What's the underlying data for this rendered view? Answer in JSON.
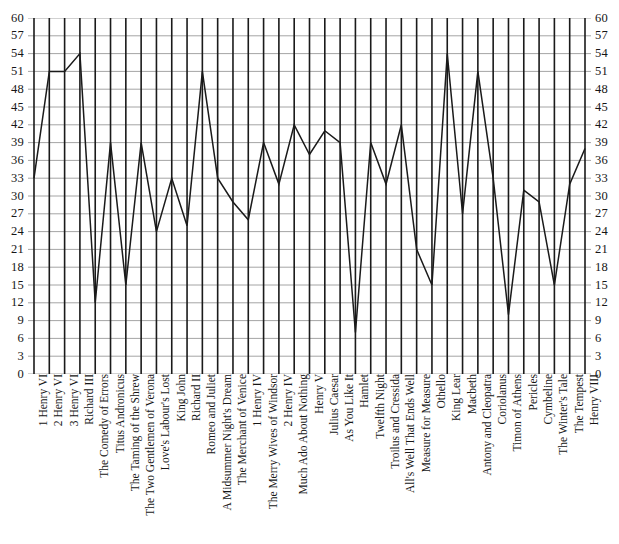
{
  "chart_data": {
    "type": "line",
    "title": "",
    "subtitle": "",
    "xlabel": "",
    "ylabel": "",
    "ylim": [
      0,
      60
    ],
    "ytick_step": 3,
    "yticks": [
      0,
      3,
      6,
      9,
      12,
      15,
      18,
      21,
      24,
      27,
      30,
      33,
      36,
      39,
      42,
      45,
      48,
      51,
      54,
      57,
      60
    ],
    "grid": true,
    "grid_vertical": true,
    "grid_horizontal": true,
    "legend": "none",
    "axis_labels_both_sides": true,
    "line_color": "#1a1a1a",
    "grid_color_horizontal": "#9a9a9a",
    "grid_color_vertical": "#1a1a1a",
    "background": "#ffffff",
    "categories": [
      "1 Henry VI",
      "2 Henry VI",
      "3 Henry VI",
      "Richard III",
      "The Comedy of Errors",
      "Titus Andronicus",
      "The Taming of the Shrew",
      "The Two Gentlemen of Verona",
      "Love's Labour's Lost",
      "King John",
      "Richard II",
      "Romeo and Juliet",
      "A Midsummer Night's Dream",
      "The Merchant of Venice",
      "1 Henry IV",
      "The Merry Wives of Windsor",
      "2 Henry IV",
      "Much Ado About Nothing",
      "Henry V",
      "Julius Caesar",
      "As You Like It",
      "Hamlet",
      "Twelfth Night",
      "Troilus and Cressida",
      "All's Well That Ends Well",
      "Measure for Measure",
      "Othello",
      "King Lear",
      "Macbeth",
      "Antony and Cleopatra",
      "Coriolanus",
      "Timon of Athens",
      "Pericles",
      "Cymbeline",
      "The Winter's Tale",
      "The Tempest",
      "Henry VIII"
    ],
    "values": [
      33,
      51,
      51,
      54,
      12,
      39,
      15,
      39,
      24,
      33,
      25,
      51,
      33,
      29,
      26,
      39,
      32,
      42,
      37,
      41,
      39,
      7,
      39,
      32,
      42,
      21,
      15,
      54,
      27,
      51,
      33,
      10,
      31,
      29,
      15,
      32,
      38
    ]
  }
}
